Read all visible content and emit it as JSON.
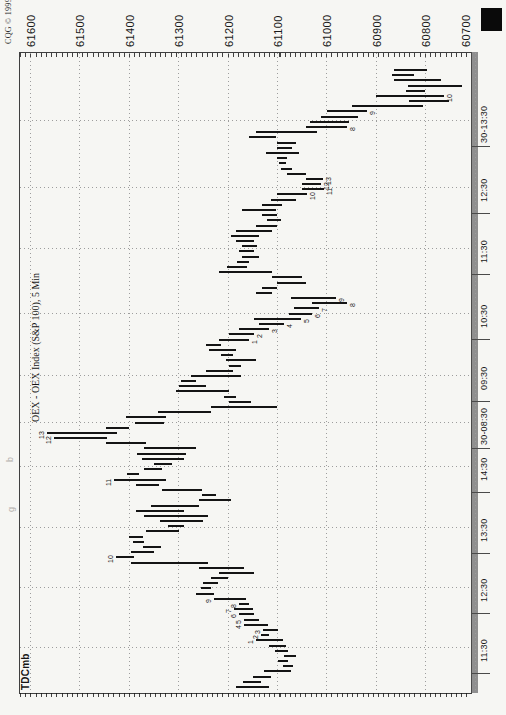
{
  "branding": {
    "copyright": "CQG © 1999"
  },
  "chart_title": "OEX - OEX Index (S&P 100), 5 Min",
  "study_label": "TDCmb",
  "marginalia": [
    "b",
    "g"
  ],
  "chart_data": {
    "type": "bar",
    "subtype": "ohlc-high-low-bars",
    "title": "OEX - OEX Index (S&P 100), 5 Min",
    "study": "TDCmb",
    "orientation": "rotated-90ccw: price axis on top (high prices at left), time axis on right (time increases upward)",
    "interval_minutes": 5,
    "ylim": [
      60690,
      61620
    ],
    "price_axis": {
      "side": "top",
      "tick_values": [
        61600,
        61500,
        61400,
        61300,
        61200,
        61100,
        61000,
        60900,
        60800,
        60700
      ],
      "tick_labels": [
        "61600",
        "61500",
        "61400",
        "61300",
        "61200",
        "61100",
        "61000",
        "60900",
        "60800",
        "60700"
      ]
    },
    "time_axis": {
      "side": "right",
      "ticks": [
        {
          "text": "11:30",
          "y": 647
        },
        {
          "text": "12:30",
          "y": 587
        },
        {
          "text": "13:30",
          "y": 527
        },
        {
          "text": "14:30",
          "y": 466
        },
        {
          "text": "30-08:30",
          "y": 422
        },
        {
          "text": "09:30",
          "y": 375
        },
        {
          "text": "10:30",
          "y": 313
        },
        {
          "text": "11:30",
          "y": 248
        },
        {
          "text": "12:30",
          "y": 187
        },
        {
          "text": "30-13:30",
          "y": 120
        }
      ]
    },
    "bars_note": "each bar = [high, low, count_label(optional), count_side h=high/l=low], chronological order",
    "bars": [
      [
        61183,
        61116
      ],
      [
        61168,
        61132
      ],
      [
        61148,
        61112
      ],
      [
        61126,
        61071
      ],
      [
        61087,
        61067
      ],
      [
        61097,
        61077
      ],
      [
        61085,
        61061
      ],
      [
        61105,
        61077
      ],
      [
        61116,
        61081
      ],
      [
        61142,
        61087,
        "1",
        "h"
      ],
      [
        61132,
        61116,
        "2",
        "h"
      ],
      [
        61128,
        61097,
        "3",
        "h"
      ],
      [
        61166,
        61118,
        "4",
        "h"
      ],
      [
        61166,
        61136,
        "5",
        "h"
      ],
      [
        61176,
        61146,
        "6",
        "h"
      ],
      [
        61187,
        61148,
        "7",
        "h"
      ],
      [
        61176,
        61156,
        "8",
        "h"
      ],
      [
        61227,
        61162,
        "9",
        "h"
      ],
      [
        61264,
        61227
      ],
      [
        61253,
        61233
      ],
      [
        61249,
        61219
      ],
      [
        61233,
        61199
      ],
      [
        61217,
        61146
      ],
      [
        61258,
        61166
      ],
      [
        61395,
        61239
      ],
      [
        61426,
        61389,
        "10",
        "h"
      ],
      [
        61395,
        61349
      ],
      [
        61371,
        61335
      ],
      [
        61391,
        61369
      ],
      [
        61400,
        61371
      ],
      [
        61365,
        61298
      ],
      [
        61320,
        61288
      ],
      [
        61337,
        61249
      ],
      [
        61369,
        61239
      ],
      [
        61385,
        61288
      ],
      [
        61355,
        61258
      ],
      [
        61258,
        61193
      ],
      [
        61251,
        61223
      ],
      [
        61333,
        61251
      ],
      [
        61385,
        61339
      ],
      [
        61430,
        61324,
        "11",
        "h"
      ],
      [
        61404,
        61379
      ],
      [
        61369,
        61333
      ],
      [
        61349,
        61312
      ],
      [
        61373,
        61288
      ],
      [
        61383,
        61284
      ],
      [
        61369,
        61264
      ],
      [
        61446,
        61365
      ],
      [
        61552,
        61444,
        "12",
        "h"
      ],
      [
        61566,
        61424,
        "13",
        "h"
      ],
      [
        61446,
        61400
      ],
      [
        61387,
        61329
      ],
      [
        61406,
        61324
      ],
      [
        61341,
        61233
      ],
      [
        61233,
        61101
      ],
      [
        61197,
        61152
      ],
      [
        61207,
        61183
      ],
      [
        61304,
        61197
      ],
      [
        61298,
        61243
      ],
      [
        61294,
        61264
      ],
      [
        61274,
        61172
      ],
      [
        61243,
        61189
      ],
      [
        61197,
        61172
      ],
      [
        61203,
        61142
      ],
      [
        61213,
        61189
      ],
      [
        61237,
        61183
      ],
      [
        61243,
        61213
      ],
      [
        61217,
        61156,
        "1",
        "l"
      ],
      [
        61197,
        61146,
        "2",
        "l"
      ],
      [
        61176,
        61116,
        "3",
        "l"
      ],
      [
        61136,
        61085,
        "4",
        "l"
      ],
      [
        61146,
        61051,
        "5",
        "l"
      ],
      [
        61075,
        61030,
        "6",
        "l"
      ],
      [
        61065,
        61014,
        "7",
        "l"
      ],
      [
        61030,
        60959,
        "8",
        "l"
      ],
      [
        61071,
        60980,
        "9",
        "l"
      ],
      [
        61142,
        61110
      ],
      [
        61130,
        61099
      ],
      [
        61099,
        61041
      ],
      [
        61110,
        61049
      ],
      [
        61217,
        61110
      ],
      [
        61201,
        61160
      ],
      [
        61180,
        61156
      ],
      [
        61170,
        61136
      ],
      [
        61176,
        61146
      ],
      [
        61170,
        61140
      ],
      [
        61183,
        61146
      ],
      [
        61193,
        61136
      ],
      [
        61183,
        61110
      ],
      [
        61142,
        61099
      ],
      [
        61120,
        61091
      ],
      [
        61130,
        61099
      ],
      [
        61170,
        61101
      ],
      [
        61130,
        61089
      ],
      [
        61112,
        61061
      ],
      [
        61099,
        61039,
        "10",
        "l"
      ],
      [
        61049,
        61004,
        "11",
        "l"
      ],
      [
        61049,
        61010,
        "12",
        "l"
      ],
      [
        61041,
        61006,
        "13",
        "l"
      ],
      [
        61079,
        61041
      ],
      [
        61091,
        61069
      ],
      [
        61095,
        61081
      ],
      [
        61099,
        61079
      ],
      [
        61122,
        61055
      ],
      [
        61101,
        61069
      ],
      [
        61099,
        61061
      ],
      [
        61156,
        61101
      ],
      [
        61142,
        61020
      ],
      [
        61041,
        60959,
        "8",
        "l"
      ],
      [
        61034,
        60955
      ],
      [
        61010,
        60937
      ],
      [
        60998,
        60918,
        "9",
        "l"
      ],
      [
        60949,
        60805
      ],
      [
        60832,
        60751
      ],
      [
        60899,
        60762,
        "10",
        "l"
      ],
      [
        60838,
        60801
      ],
      [
        60834,
        60726
      ],
      [
        60864,
        60767
      ],
      [
        60868,
        60822
      ],
      [
        60864,
        60797
      ]
    ]
  }
}
